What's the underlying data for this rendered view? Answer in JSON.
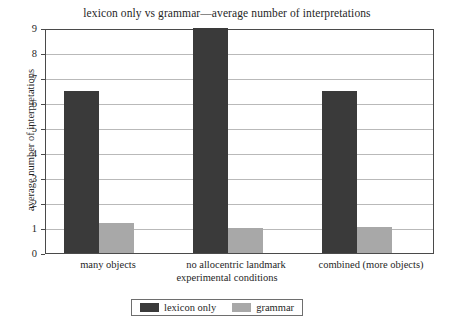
{
  "chart_data": {
    "type": "bar",
    "title": "lexicon only vs grammar—average number of interpretations",
    "xlabel": "experimental conditions",
    "ylabel": "average number of interpretations",
    "categories": [
      "many objects",
      "no allocentric landmark",
      "combined (more objects)"
    ],
    "series": [
      {
        "name": "lexicon only",
        "color": "#3a3a3a",
        "values": [
          6.5,
          9.0,
          6.5
        ]
      },
      {
        "name": "grammar",
        "color": "#a8a8a8",
        "values": [
          1.2,
          1.0,
          1.05
        ]
      }
    ],
    "ylim": [
      0,
      9
    ],
    "yticks": [
      "0",
      "1",
      "2",
      "3",
      "4",
      "5",
      "6",
      "7",
      "8",
      "9"
    ],
    "grid": true,
    "legend_position": "bottom-center"
  },
  "legend": {
    "entries": [
      {
        "label": "lexicon only"
      },
      {
        "label": "grammar"
      }
    ]
  }
}
